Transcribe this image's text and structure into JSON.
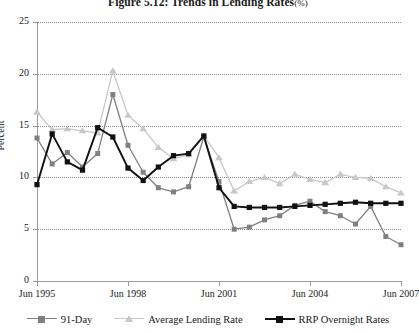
{
  "figure": {
    "title_main": "Figure 5.12:  Trends in Lending Rates",
    "title_unit": "(%)"
  },
  "axes": {
    "ylabel": "Percent",
    "yticks": [
      "25",
      "20",
      "15",
      "10",
      "5",
      "0"
    ],
    "xticks": [
      "Jun 1995",
      "Jun 1998",
      "Jun 2001",
      "Jun 2004",
      "Jun 2007"
    ]
  },
  "legend": {
    "items": [
      {
        "label": "91-Day",
        "color": "#808080",
        "marker": "square"
      },
      {
        "label": "Average Lending Rate",
        "color": "#c8c8c8",
        "marker": "triangle"
      },
      {
        "label": "RRP Overnight Rates",
        "color": "#111111",
        "marker": "square"
      }
    ]
  },
  "chart_data": {
    "type": "line",
    "xlabel": "",
    "ylabel": "Percent",
    "ylim": [
      0,
      25
    ],
    "ytick_step": 5,
    "grid": true,
    "grid_style": "dotted-horizontal",
    "legend_position": "bottom",
    "x_tick_labels": [
      "Jun 1995",
      "Jun 1998",
      "Jun 2001",
      "Jun 2004",
      "Jun 2007"
    ],
    "x_tick_values": [
      1995.5,
      1998.5,
      2001.5,
      2004.5,
      2007.5
    ],
    "x_range": [
      1995.5,
      2007.5
    ],
    "frequency": "semi-annual",
    "x": [
      1995.5,
      1996.0,
      1996.5,
      1997.0,
      1997.5,
      1998.0,
      1998.5,
      1999.0,
      1999.5,
      2000.0,
      2000.5,
      2001.0,
      2001.5,
      2002.0,
      2002.5,
      2003.0,
      2003.5,
      2004.0,
      2004.5,
      2005.0,
      2005.5,
      2006.0,
      2006.5,
      2007.0,
      2007.5
    ],
    "series": [
      {
        "name": "91-Day",
        "color": "#808080",
        "marker": "square",
        "values": [
          13.8,
          11.3,
          12.4,
          11.0,
          12.3,
          18.0,
          13.1,
          10.5,
          9.0,
          8.6,
          9.1,
          13.9,
          9.6,
          5.0,
          5.2,
          5.9,
          6.3,
          7.3,
          7.7,
          6.7,
          6.3,
          5.5,
          7.2,
          4.3,
          3.5
        ]
      },
      {
        "name": "Average Lending Rate",
        "color": "#c8c8c8",
        "marker": "triangle",
        "values": [
          16.3,
          14.6,
          14.7,
          14.5,
          14.3,
          20.3,
          16.0,
          14.7,
          12.9,
          11.8,
          12.2,
          14.0,
          11.9,
          8.7,
          9.6,
          10.0,
          9.4,
          10.3,
          9.8,
          9.5,
          10.3,
          10.0,
          9.9,
          9.1,
          8.5
        ]
      },
      {
        "name": "RRP Overnight Rates",
        "color": "#111111",
        "marker": "square",
        "values": [
          9.3,
          14.2,
          11.5,
          10.7,
          14.8,
          13.9,
          10.9,
          9.7,
          11.0,
          12.1,
          12.3,
          14.0,
          9.0,
          7.2,
          7.1,
          7.1,
          7.1,
          7.2,
          7.3,
          7.4,
          7.5,
          7.6,
          7.5,
          7.5,
          7.5
        ]
      }
    ]
  }
}
